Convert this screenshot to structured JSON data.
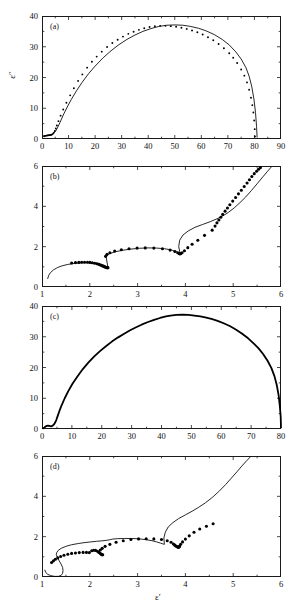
{
  "figure": {
    "axis_titles": {
      "x": "ε′",
      "y": "ε″"
    },
    "panel_tags": {
      "a": "(a)",
      "b": "(b)",
      "c": "(c)",
      "d": "(d)"
    },
    "colors": {
      "ink": "#1a1a1a",
      "marker": "#000000",
      "curve": "#000000"
    }
  },
  "chart_data": [
    {
      "type": "scatter",
      "panel": "a",
      "title": "(a)",
      "xlabel": "",
      "ylabel": "ε″",
      "xlim": [
        0,
        90
      ],
      "ylim": [
        0,
        40
      ],
      "xticks": [
        0,
        10,
        20,
        30,
        40,
        50,
        60,
        70,
        80,
        90
      ],
      "yticks": [
        0,
        10,
        20,
        30,
        40
      ],
      "grid": false,
      "legend": "none",
      "series": [
        {
          "name": "data",
          "style": "points",
          "x": [
            0.8,
            1.2,
            1.6,
            2.0,
            2.4,
            2.8,
            3.2,
            3.6,
            4.0,
            4.4,
            4.8,
            5.2,
            5.6,
            6.2,
            7.0,
            8.0,
            9.2,
            10.6,
            12.0,
            13.6,
            15.2,
            17.0,
            18.8,
            20.6,
            22.5,
            24.5,
            26.5,
            28.5,
            30.5,
            32.5,
            34.5,
            36.5,
            38.5,
            40.5,
            42.5,
            44.5,
            46.5,
            48.5,
            50.5,
            52.5,
            54.5,
            56.5,
            58.5,
            60.5,
            62.5,
            64.5,
            66.5,
            68.5,
            70.5,
            72.0,
            73.5,
            75.0,
            76.2,
            77.2,
            78.0,
            78.7,
            79.2,
            79.6,
            79.9,
            80.1,
            80.2
          ],
          "y": [
            0.9,
            1.0,
            1.1,
            1.15,
            1.2,
            1.25,
            1.3,
            1.4,
            1.6,
            2.0,
            2.6,
            3.4,
            4.4,
            5.8,
            7.6,
            9.6,
            11.8,
            14.2,
            16.5,
            18.9,
            21.0,
            23.2,
            25.1,
            26.8,
            28.4,
            29.9,
            31.2,
            32.3,
            33.3,
            34.2,
            34.9,
            35.5,
            36.0,
            36.4,
            36.7,
            36.8,
            36.8,
            36.7,
            36.5,
            36.2,
            35.8,
            35.3,
            34.7,
            34.0,
            33.1,
            32.1,
            30.9,
            29.5,
            27.9,
            26.4,
            24.7,
            22.6,
            20.6,
            18.4,
            16.0,
            13.4,
            11.0,
            8.6,
            6.0,
            3.2,
            0.8
          ]
        },
        {
          "name": "fit",
          "style": "line",
          "x": [
            0.6,
            1.5,
            2.5,
            3.4,
            4.2,
            5.0,
            5.8,
            6.8,
            8.0,
            9.5,
            11.0,
            13.0,
            15.0,
            17.5,
            20.0,
            23.0,
            26.0,
            29.0,
            32.0,
            35.0,
            38.0,
            41.0,
            44.0,
            47.0,
            50.0,
            53.0,
            56.0,
            59.0,
            62.0,
            65.0,
            68.0,
            70.5,
            73.0,
            75.0,
            76.8,
            78.0,
            79.0,
            79.8,
            80.4,
            80.8,
            81.0
          ],
          "y": [
            1.0,
            1.1,
            1.2,
            1.35,
            1.7,
            2.4,
            3.6,
            5.4,
            7.8,
            10.4,
            12.8,
            15.7,
            18.3,
            21.2,
            23.7,
            26.4,
            28.7,
            30.7,
            32.4,
            33.8,
            35.0,
            35.9,
            36.6,
            37.0,
            37.1,
            37.0,
            36.6,
            36.0,
            35.1,
            33.9,
            32.3,
            30.6,
            28.3,
            26.0,
            23.2,
            20.4,
            17.0,
            13.0,
            8.6,
            4.0,
            0.6
          ]
        }
      ]
    },
    {
      "type": "scatter",
      "panel": "b",
      "title": "(b)",
      "xlabel": "",
      "ylabel": "",
      "xlim": [
        1,
        6
      ],
      "ylim": [
        0,
        6
      ],
      "xticks": [
        1,
        2,
        3,
        4,
        5,
        6
      ],
      "yticks": [
        0,
        2,
        4,
        6
      ],
      "grid": false,
      "legend": "none",
      "series": [
        {
          "name": "data",
          "style": "points",
          "x": [
            1.62,
            1.7,
            1.77,
            1.83,
            1.89,
            1.95,
            2.0,
            2.05,
            2.1,
            2.15,
            2.19,
            2.23,
            2.26,
            2.29,
            2.31,
            2.33,
            2.35,
            2.36,
            2.37,
            2.38,
            2.33,
            2.36,
            2.42,
            2.52,
            2.66,
            2.82,
            2.99,
            3.16,
            3.34,
            3.52,
            3.68,
            3.78,
            3.84,
            3.87,
            3.88,
            3.9,
            3.93,
            3.98,
            4.05,
            4.14,
            4.26,
            4.4,
            4.56,
            4.62,
            4.66,
            4.7,
            4.74,
            4.78,
            4.83,
            4.88,
            4.93,
            4.99,
            5.05,
            5.11,
            5.17,
            5.23,
            5.29,
            5.34,
            5.39,
            5.44,
            5.49,
            5.53,
            5.57
          ],
          "y": [
            1.19,
            1.21,
            1.22,
            1.23,
            1.23,
            1.23,
            1.22,
            1.2,
            1.18,
            1.15,
            1.12,
            1.08,
            1.05,
            1.02,
            1.0,
            0.98,
            0.97,
            0.96,
            0.96,
            0.96,
            1.52,
            1.62,
            1.7,
            1.78,
            1.85,
            1.9,
            1.93,
            1.94,
            1.93,
            1.9,
            1.83,
            1.76,
            1.7,
            1.66,
            1.64,
            1.65,
            1.7,
            1.8,
            1.95,
            2.12,
            2.32,
            2.56,
            2.82,
            3.02,
            3.18,
            3.32,
            3.46,
            3.6,
            3.76,
            3.92,
            4.08,
            4.26,
            4.44,
            4.62,
            4.8,
            4.98,
            5.16,
            5.32,
            5.48,
            5.62,
            5.74,
            5.84,
            5.92
          ]
        },
        {
          "name": "fit",
          "style": "line",
          "x": [
            1.12,
            1.14,
            1.18,
            1.24,
            1.32,
            1.42,
            1.54,
            1.68,
            1.82,
            1.96,
            2.08,
            2.18,
            2.26,
            2.31,
            2.35,
            2.37,
            2.38,
            2.34,
            2.4,
            2.52,
            2.68,
            2.86,
            3.04,
            3.22,
            3.4,
            3.56,
            3.7,
            3.8,
            3.86,
            3.89,
            3.86,
            3.88,
            3.95,
            4.06,
            4.2,
            4.36,
            4.52,
            4.66,
            4.78,
            4.9,
            5.02,
            5.14,
            5.26,
            5.38,
            5.5,
            5.62,
            5.72,
            5.8
          ],
          "y": [
            0.42,
            0.58,
            0.72,
            0.85,
            0.96,
            1.05,
            1.12,
            1.17,
            1.2,
            1.21,
            1.2,
            1.17,
            1.12,
            1.07,
            1.02,
            0.98,
            0.96,
            1.52,
            1.64,
            1.74,
            1.82,
            1.88,
            1.92,
            1.94,
            1.93,
            1.9,
            1.84,
            1.76,
            1.7,
            1.66,
            2.0,
            2.32,
            2.58,
            2.78,
            2.96,
            3.1,
            3.24,
            3.38,
            3.52,
            3.7,
            3.92,
            4.18,
            4.46,
            4.78,
            5.12,
            5.46,
            5.74,
            5.96
          ]
        }
      ]
    },
    {
      "type": "line",
      "panel": "c",
      "title": "(c)",
      "xlabel": "",
      "ylabel": "",
      "xlim": [
        0,
        80
      ],
      "ylim": [
        0,
        40
      ],
      "xticks": [
        0,
        10,
        20,
        30,
        40,
        50,
        60,
        70,
        80
      ],
      "yticks": [
        0,
        10,
        20,
        30,
        40
      ],
      "grid": false,
      "legend": "none",
      "series": [
        {
          "name": "model",
          "style": "line",
          "x": [
            0.3,
            0.8,
            1.2,
            1.6,
            2.0,
            2.4,
            2.8,
            3.2,
            3.6,
            4.0,
            4.4,
            4.8,
            5.2,
            5.8,
            6.6,
            7.6,
            8.8,
            10.2,
            11.8,
            13.6,
            15.5,
            17.5,
            19.5,
            21.5,
            23.5,
            25.5,
            27.5,
            29.5,
            31.5,
            33.5,
            35.5,
            37.5,
            39.5,
            41.5,
            43.0,
            45.0,
            47.0,
            49.0,
            51.0,
            53.0,
            55.0,
            57.0,
            59.0,
            61.0,
            63.0,
            65.0,
            67.0,
            69.0,
            71.0,
            72.5,
            74.0,
            75.5,
            76.8,
            77.8,
            78.6,
            79.2,
            79.6,
            79.9,
            80.0
          ],
          "y": [
            0.2,
            0.5,
            0.8,
            1.0,
            1.1,
            1.0,
            0.9,
            0.9,
            1.1,
            1.5,
            2.1,
            3.0,
            4.1,
            5.8,
            7.8,
            10.0,
            12.3,
            14.7,
            17.0,
            19.4,
            21.6,
            23.6,
            25.4,
            27.0,
            28.5,
            29.8,
            31.0,
            32.1,
            33.1,
            34.0,
            34.8,
            35.5,
            36.1,
            36.6,
            36.9,
            37.1,
            37.2,
            37.1,
            36.9,
            36.6,
            36.2,
            35.7,
            35.1,
            34.3,
            33.4,
            32.3,
            31.0,
            29.5,
            27.7,
            26.2,
            24.4,
            22.2,
            19.8,
            17.2,
            14.2,
            11.0,
            7.6,
            4.0,
            0.5
          ]
        }
      ]
    },
    {
      "type": "scatter",
      "panel": "d",
      "title": "(d)",
      "xlabel": "ε′",
      "ylabel": "",
      "xlim": [
        1,
        6
      ],
      "ylim": [
        0,
        6
      ],
      "xticks": [
        1,
        2,
        3,
        4,
        5,
        6
      ],
      "yticks": [
        0,
        2,
        4,
        6
      ],
      "grid": false,
      "legend": "none",
      "series": [
        {
          "name": "data",
          "style": "points",
          "x": [
            1.2,
            1.24,
            1.28,
            1.33,
            1.39,
            1.46,
            1.54,
            1.62,
            1.7,
            1.78,
            1.86,
            1.93,
            1.99,
            2.04,
            2.08,
            2.12,
            2.16,
            2.19,
            2.22,
            2.24,
            2.25,
            2.26,
            2.27,
            2.22,
            2.26,
            2.32,
            2.42,
            2.55,
            2.7,
            2.86,
            3.02,
            3.18,
            3.34,
            3.5,
            3.62,
            3.7,
            3.75,
            3.78,
            3.8,
            3.82,
            3.84,
            3.85,
            3.86,
            3.87,
            3.88,
            3.9,
            3.94,
            4.0,
            4.08,
            4.18,
            4.3,
            4.44,
            4.58
          ],
          "y": [
            0.72,
            0.8,
            0.88,
            0.95,
            1.02,
            1.08,
            1.13,
            1.17,
            1.19,
            1.21,
            1.22,
            1.22,
            1.21,
            1.3,
            1.33,
            1.32,
            1.28,
            1.22,
            1.17,
            1.13,
            1.11,
            1.1,
            1.1,
            1.34,
            1.42,
            1.52,
            1.62,
            1.72,
            1.8,
            1.86,
            1.89,
            1.9,
            1.89,
            1.86,
            1.8,
            1.72,
            1.64,
            1.58,
            1.54,
            1.51,
            1.49,
            1.48,
            1.48,
            1.5,
            1.54,
            1.62,
            1.74,
            1.88,
            2.04,
            2.22,
            2.38,
            2.52,
            2.64
          ]
        },
        {
          "name": "model",
          "style": "line",
          "x": [
            1.06,
            1.08,
            1.12,
            1.18,
            1.26,
            1.34,
            1.4,
            1.43,
            1.44,
            1.43,
            1.4,
            1.36,
            1.33,
            1.31,
            1.3,
            1.31,
            1.34,
            1.4,
            1.5,
            1.62,
            1.76,
            1.9,
            2.02,
            2.14,
            2.24,
            2.32,
            2.38,
            2.42,
            2.44,
            2.48,
            2.58,
            2.72,
            2.88,
            3.04,
            3.18,
            3.3,
            3.4,
            3.48,
            3.53,
            3.56,
            3.55,
            3.58,
            3.64,
            3.74,
            3.86,
            4.0,
            4.14,
            4.28,
            4.42,
            4.56,
            4.7,
            4.84,
            4.96,
            5.08,
            5.18,
            5.28,
            5.36
          ],
          "y": [
            0.34,
            0.22,
            0.13,
            0.07,
            0.03,
            0.03,
            0.08,
            0.18,
            0.32,
            0.48,
            0.64,
            0.8,
            0.94,
            1.04,
            1.12,
            1.22,
            1.32,
            1.42,
            1.52,
            1.6,
            1.66,
            1.71,
            1.74,
            1.77,
            1.79,
            1.81,
            1.83,
            1.85,
            1.86,
            1.88,
            1.9,
            1.91,
            1.91,
            1.89,
            1.85,
            1.8,
            1.74,
            1.68,
            1.64,
            1.62,
            1.94,
            2.22,
            2.48,
            2.7,
            2.9,
            3.08,
            3.26,
            3.46,
            3.68,
            3.94,
            4.24,
            4.58,
            4.9,
            5.22,
            5.5,
            5.76,
            5.96
          ]
        }
      ]
    }
  ]
}
